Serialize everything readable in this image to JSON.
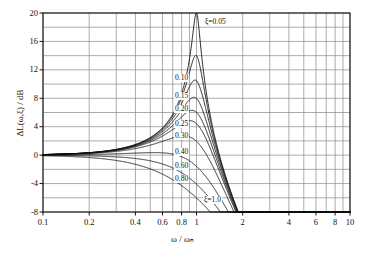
{
  "chart_data": {
    "type": "line",
    "title": "",
    "xlabel": "ω / ωₙ",
    "ylabel": "ΔL(ω,ξ) / dB",
    "xscale": "log",
    "xlim": [
      0.1,
      10
    ],
    "ylim": [
      -8,
      20
    ],
    "grid": true,
    "legend": "inline-curve-labels",
    "xticks": [
      {
        "value": 0.1,
        "label": "0.1"
      },
      {
        "value": 0.2,
        "label": "0.2"
      },
      {
        "value": 0.4,
        "label": "0.4"
      },
      {
        "value": 0.6,
        "label": "0.6"
      },
      {
        "value": 0.8,
        "label": "0.8"
      },
      {
        "value": 1,
        "label": "1"
      },
      {
        "value": 2,
        "label": "2"
      },
      {
        "value": 4,
        "label": "4"
      },
      {
        "value": 6,
        "label": "6"
      },
      {
        "value": 8,
        "label": "8"
      },
      {
        "value": 10,
        "label": "10"
      }
    ],
    "yticks": [
      {
        "value": 20,
        "label": "20"
      },
      {
        "value": 16,
        "label": "16"
      },
      {
        "value": 12,
        "label": "12"
      },
      {
        "value": 8,
        "label": "8"
      },
      {
        "value": 4,
        "label": "4"
      },
      {
        "value": 0,
        "label": "0"
      },
      {
        "value": -4,
        "label": "-4"
      },
      {
        "value": -8,
        "label": "-8"
      }
    ],
    "y_gridline_values": [
      20,
      18,
      16,
      14,
      12,
      10,
      8,
      6,
      4,
      2,
      0,
      -2,
      -4,
      -6,
      -8
    ],
    "x_gridline_values": [
      0.1,
      0.2,
      0.3,
      0.4,
      0.5,
      0.6,
      0.7,
      0.8,
      0.9,
      1,
      2,
      3,
      4,
      5,
      6,
      7,
      8,
      9,
      10
    ],
    "formula": "dL = -20*log10( sqrt( (1-r^2)^2 + (2*zeta*r)^2 ) )",
    "series": [
      {
        "name": "ξ=0.05",
        "zeta": 0.05,
        "label": "ξ=0.05",
        "peak_db": 20.0,
        "peak_at": 1.0
      },
      {
        "name": "0.10",
        "zeta": 0.1,
        "label": "0.10",
        "peak_db": 14.0,
        "peak_at": 0.99
      },
      {
        "name": "0.15",
        "zeta": 0.15,
        "label": "0.15",
        "peak_db": 10.5,
        "peak_at": 0.977
      },
      {
        "name": "0.20",
        "zeta": 0.2,
        "label": "0.20",
        "peak_db": 8.1,
        "peak_at": 0.959
      },
      {
        "name": "0.25",
        "zeta": 0.25,
        "label": "0.25",
        "peak_db": 6.3,
        "peak_at": 0.935
      },
      {
        "name": "0.30",
        "zeta": 0.3,
        "label": "0.30",
        "peak_db": 4.8,
        "peak_at": 0.906
      },
      {
        "name": "0.40",
        "zeta": 0.4,
        "label": "0.40",
        "peak_db": 2.7,
        "peak_at": 0.825
      },
      {
        "name": "0.60",
        "zeta": 0.6,
        "label": "0.60",
        "peak_db": 0.35,
        "peak_at": 0.529
      },
      {
        "name": "0.80",
        "zeta": 0.8,
        "label": "0.80",
        "peak_db": 0.0,
        "peak_at": 0.0
      },
      {
        "name": "ξ=1.0",
        "zeta": 1.0,
        "label": "ξ=1.0",
        "peak_db": -6.0,
        "peak_at": 1.0
      }
    ],
    "curve_labels": [
      {
        "text": "ξ=0.05",
        "x_px": 204,
        "y_px": 18
      },
      {
        "text": "0.10",
        "x_px": 174,
        "y_px": 74
      },
      {
        "text": "0.15",
        "x_px": 174,
        "y_px": 92
      },
      {
        "text": "0.20",
        "x_px": 174,
        "y_px": 105
      },
      {
        "text": "0.25",
        "x_px": 174,
        "y_px": 120
      },
      {
        "text": "0.30",
        "x_px": 174,
        "y_px": 132
      },
      {
        "text": "0.40",
        "x_px": 174,
        "y_px": 148
      },
      {
        "text": "0.60",
        "x_px": 174,
        "y_px": 162
      },
      {
        "text": "0.80",
        "x_px": 174,
        "y_px": 175
      },
      {
        "text": "ξ=1.0",
        "x_px": 203,
        "y_px": 196
      }
    ],
    "colors": {
      "curve": "#111111",
      "grid": "#888888",
      "axis": "#111111",
      "background": "#ffffff"
    }
  }
}
